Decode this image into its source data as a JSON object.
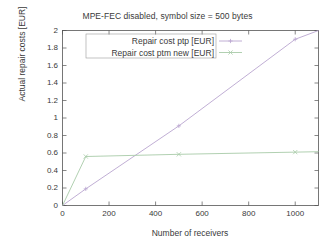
{
  "chart_data": {
    "type": "line",
    "title": "MPE-FEC disabled, symbol size = 500 bytes",
    "xlabel": "Number of receivers",
    "ylabel": "Actual repair costs [EUR]",
    "xlim": [
      0,
      1100
    ],
    "ylim": [
      0,
      2
    ],
    "xticks": [
      0,
      200,
      400,
      600,
      800,
      1000
    ],
    "xtick_labels": [
      "0",
      "200",
      "400",
      "600",
      "800",
      "1000"
    ],
    "yticks": [
      0,
      0.2,
      0.4,
      0.6,
      0.8,
      1,
      1.2,
      1.4,
      1.6,
      1.8,
      2
    ],
    "ytick_labels": [
      "0",
      "0.2",
      "0.4",
      "0.6",
      "0.8",
      "1",
      "1.2",
      "1.4",
      "1.6",
      "1.8",
      "2"
    ],
    "grid": false,
    "legend_position": "top-center-inside",
    "series": [
      {
        "name": "Repair cost ptp [EUR]",
        "color": "#b9a5cf",
        "marker": "plus",
        "x": [
          0,
          100,
          500,
          1000,
          1100
        ],
        "values": [
          0.0,
          0.19,
          0.91,
          1.9,
          2.0
        ]
      },
      {
        "name": "Repair cost ptm new [EUR]",
        "color": "#a8cba8",
        "marker": "cross",
        "x": [
          0,
          100,
          500,
          1000,
          1100
        ],
        "values": [
          0.0,
          0.56,
          0.585,
          0.61,
          0.615
        ]
      }
    ]
  },
  "legend": {
    "entries": [
      {
        "label": "Repair cost ptp [EUR]"
      },
      {
        "label": "Repair cost ptm new [EUR]"
      }
    ]
  },
  "colors": {
    "axis": "#555555",
    "text": "#3a3a3a",
    "background": "#ffffff",
    "series_1": "#b9a5cf",
    "series_2": "#a8cba8"
  }
}
